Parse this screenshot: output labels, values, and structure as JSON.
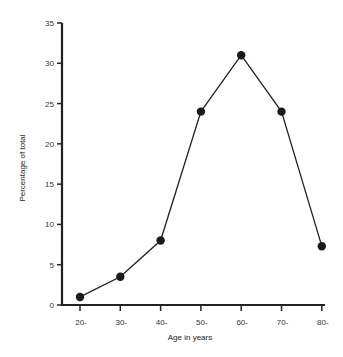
{
  "chart_data": {
    "type": "line",
    "title": "",
    "xlabel": "Age in years",
    "ylabel": "Percentage of total",
    "categories": [
      "20-",
      "30-",
      "40-",
      "50-",
      "60-",
      "70-",
      "80-"
    ],
    "series": [
      {
        "name": "Percentage of total",
        "values": [
          1,
          3.5,
          8,
          24,
          31,
          24,
          7.3
        ]
      }
    ],
    "yticks": [
      0,
      5,
      10,
      15,
      20,
      25,
      30,
      35
    ],
    "ylim": [
      0,
      35
    ],
    "grid": false,
    "legend": "none",
    "marker": "filled-circle",
    "colors": {
      "line": "#222222",
      "axis": "#222222",
      "marker": "#1a1a1a"
    }
  }
}
